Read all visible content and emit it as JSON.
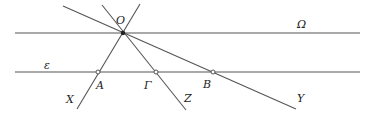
{
  "diagram": {
    "type": "geometry",
    "lines": {
      "omega": {
        "label": "Ω",
        "x1": 15,
        "y1": 33,
        "x2": 360,
        "y2": 33
      },
      "epsilon": {
        "label": "ε",
        "x1": 15,
        "y1": 72,
        "x2": 360,
        "y2": 72
      },
      "ox": {
        "label": "X",
        "x1": 140,
        "y1": 4,
        "x2": 77,
        "y2": 109
      },
      "oz": {
        "label": "Z",
        "x1": 102,
        "y1": 5,
        "x2": 186,
        "y2": 110
      },
      "oy": {
        "label": "Y",
        "x1": 63,
        "y1": 6,
        "x2": 296,
        "y2": 109
      }
    },
    "points": {
      "O": {
        "label": "O",
        "x": 123,
        "y": 33
      },
      "A": {
        "label": "A",
        "x": 98,
        "y": 72
      },
      "G": {
        "label": "Γ",
        "x": 156,
        "y": 72
      },
      "B": {
        "label": "B",
        "x": 213,
        "y": 72
      }
    },
    "labels": {
      "O": "O",
      "omega": "Ω",
      "epsilon": "ε",
      "A": "A",
      "G": "Γ",
      "B": "B",
      "X": "X",
      "Z": "Z",
      "Y": "Y"
    }
  }
}
